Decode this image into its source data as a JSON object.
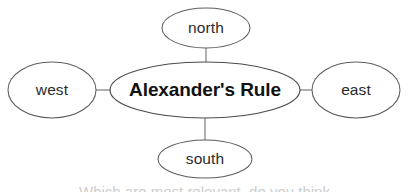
{
  "diagram": {
    "type": "concept-web",
    "background_color": "#ffffff",
    "stroke_color": "#5d5d5d",
    "text_color": "#2b2b2b",
    "center": {
      "id": "center",
      "label": "Alexander's Rule",
      "cx": 205,
      "cy": 90,
      "rx": 95,
      "ry": 28
    },
    "nodes": [
      {
        "id": "north",
        "label": "north",
        "cx": 206,
        "cy": 28,
        "rx": 44,
        "ry": 20
      },
      {
        "id": "west",
        "label": "west",
        "cx": 52,
        "cy": 90,
        "rx": 44,
        "ry": 28
      },
      {
        "id": "east",
        "label": "east",
        "cx": 356,
        "cy": 90,
        "rx": 44,
        "ry": 28
      },
      {
        "id": "south",
        "label": "south",
        "cx": 205,
        "cy": 159,
        "rx": 47,
        "ry": 19
      }
    ],
    "connectors": [
      {
        "id": "center-north",
        "x1": 206,
        "y1": 48,
        "x2": 206,
        "y2": 62
      },
      {
        "id": "center-west",
        "x1": 96,
        "y1": 90,
        "x2": 110,
        "y2": 90
      },
      {
        "id": "center-east",
        "x1": 300,
        "y1": 90,
        "x2": 312,
        "y2": 90
      },
      {
        "id": "center-south",
        "x1": 205,
        "y1": 118,
        "x2": 205,
        "y2": 140
      }
    ]
  },
  "clipped": {
    "top_text": "",
    "bottom_text": "Which are most relevant, do you think"
  }
}
